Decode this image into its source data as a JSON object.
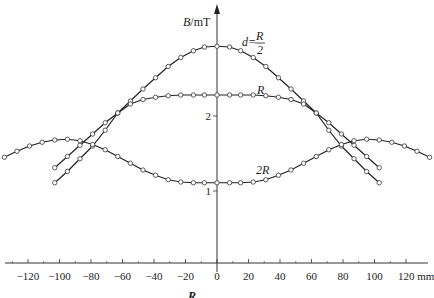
{
  "chart_data": {
    "type": "line",
    "title": "",
    "xlabel": "mm",
    "ylabel": "B/mT",
    "xlim": [
      -135,
      125
    ],
    "ylim": [
      0,
      3.2
    ],
    "x_ticks": [
      -120,
      -100,
      -80,
      -60,
      -40,
      -20,
      0,
      20,
      40,
      60,
      80,
      100,
      120
    ],
    "x_tick_labels": [
      "-120",
      "-100",
      "-80",
      "-60",
      "-40",
      "-20",
      "0",
      "20",
      "40",
      "60",
      "80",
      "100",
      "120 mm"
    ],
    "y_ticks": [
      1,
      2
    ],
    "y_tick_labels": [
      "1",
      "2"
    ],
    "grid": false,
    "legend": "inline curve labels",
    "series": [
      {
        "name": "d=R/2",
        "label_display": "d=R/2",
        "x": [
          -103,
          -95,
          -87,
          -79,
          -71,
          -63,
          -55,
          -47,
          -39,
          -31,
          -23,
          -15,
          -8,
          0,
          8,
          15,
          23,
          31,
          39,
          47,
          55,
          63,
          71,
          79,
          87,
          95,
          103
        ],
        "values": [
          1.35,
          1.5,
          1.65,
          1.8,
          1.95,
          2.08,
          2.24,
          2.4,
          2.55,
          2.7,
          2.82,
          2.91,
          2.96,
          2.97,
          2.96,
          2.91,
          2.82,
          2.7,
          2.55,
          2.4,
          2.24,
          2.08,
          1.95,
          1.8,
          1.65,
          1.5,
          1.35
        ]
      },
      {
        "name": "R",
        "label_display": "R",
        "x": [
          -103,
          -95,
          -87,
          -79,
          -71,
          -63,
          -55,
          -47,
          -39,
          -31,
          -23,
          -15,
          -8,
          0,
          8,
          15,
          23,
          31,
          39,
          47,
          55,
          63,
          71,
          79,
          87,
          95,
          103
        ],
        "values": [
          1.15,
          1.3,
          1.47,
          1.64,
          1.85,
          2.08,
          2.2,
          2.26,
          2.29,
          2.31,
          2.32,
          2.32,
          2.32,
          2.32,
          2.32,
          2.32,
          2.32,
          2.31,
          2.29,
          2.26,
          2.2,
          2.08,
          1.85,
          1.64,
          1.47,
          1.3,
          1.15
        ]
      },
      {
        "name": "2R",
        "label_display": "2R",
        "x": [
          -135,
          -127,
          -119,
          -111,
          -103,
          -95,
          -87,
          -79,
          -71,
          -63,
          -55,
          -47,
          -39,
          -31,
          -23,
          -15,
          -8,
          0,
          8,
          15,
          23,
          31,
          39,
          47,
          55,
          63,
          71,
          79,
          87,
          95,
          103,
          111,
          119,
          127,
          135
        ],
        "values": [
          1.49,
          1.57,
          1.64,
          1.69,
          1.72,
          1.73,
          1.71,
          1.66,
          1.59,
          1.5,
          1.41,
          1.32,
          1.25,
          1.19,
          1.16,
          1.15,
          1.15,
          1.15,
          1.15,
          1.15,
          1.16,
          1.19,
          1.25,
          1.32,
          1.41,
          1.5,
          1.59,
          1.66,
          1.71,
          1.73,
          1.72,
          1.69,
          1.64,
          1.57,
          1.49
        ]
      }
    ],
    "annotations": [
      "d=R/2",
      "R",
      "2R"
    ],
    "caption_fragment": "R"
  },
  "axes": {
    "y_label_main": "B",
    "y_label_unit": "/mT",
    "x_unit": "mm"
  },
  "labels": {
    "d_prefix": "d=",
    "frac_num": "R",
    "frac_den": "2",
    "r_label": "R",
    "two_r_label": "2R",
    "bottom_fragment": "R"
  }
}
